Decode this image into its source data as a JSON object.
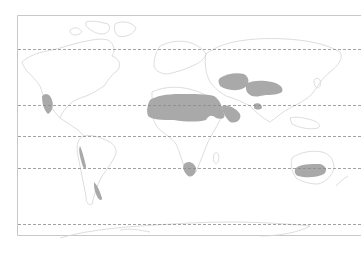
{
  "map": {
    "type": "world-outline-map",
    "projection": "equirectangular-like",
    "frame": {
      "x": 17,
      "y": 15,
      "right": 361,
      "bottom": 235,
      "stroke": "#c8c8c8"
    },
    "colors": {
      "background": "#ffffff",
      "land_outline": "#d4d4d4",
      "highlight_fill": "#a9a9a9",
      "latitude_line": "#8c8c8c"
    },
    "latitude_lines": [
      {
        "name": "arctic-circle",
        "y": 49
      },
      {
        "name": "tropic-of-cancer",
        "y": 105
      },
      {
        "name": "equator",
        "y": 136
      },
      {
        "name": "tropic-of-capricorn",
        "y": 168
      },
      {
        "name": "antarctic-circle",
        "y": 224
      }
    ],
    "highlighted_regions": [
      {
        "name": "sahara-arabian-desert"
      },
      {
        "name": "central-asian-desert"
      },
      {
        "name": "gobi-desert"
      },
      {
        "name": "thar-desert"
      },
      {
        "name": "north-american-desert"
      },
      {
        "name": "atacama-desert"
      },
      {
        "name": "patagonian-desert"
      },
      {
        "name": "namib-kalahari-desert"
      },
      {
        "name": "australian-desert"
      }
    ]
  }
}
